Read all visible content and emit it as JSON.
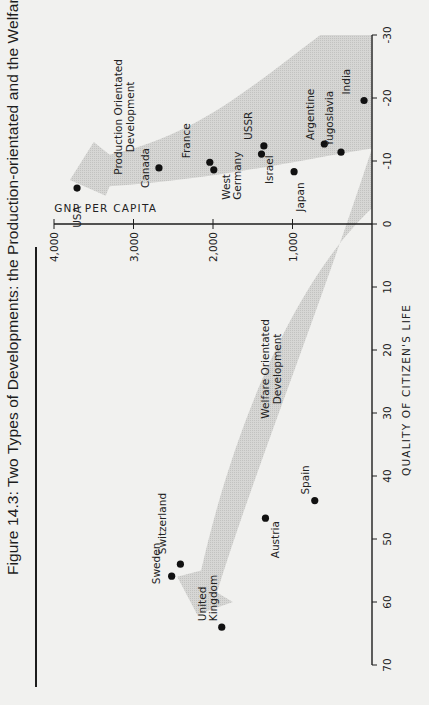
{
  "figure": {
    "title": "Figure 14.3: Two Types of Developments: the Production-orientated and the Welfare-orientated",
    "orientation": "rotated 90° counter-clockwise on page"
  },
  "chart_data": {
    "type": "scatter",
    "title": "Figure 14.3: Two Types of Developments: the Production-orientated and the Welfare-orientated",
    "xlabel": "QUALITY OF CITIZEN'S LIFE",
    "ylabel": "GNP PER CAPITA",
    "xlim": [
      70,
      -30
    ],
    "ylim": [
      0,
      4000
    ],
    "x_ticks": [
      70,
      60,
      50,
      40,
      30,
      20,
      10,
      0,
      -10,
      -20,
      -30
    ],
    "x_tick_labels": [
      "70",
      "60",
      "50",
      "40",
      "30",
      "20",
      "10",
      "0",
      "-10",
      "-20",
      "-30"
    ],
    "y_ticks": [
      0,
      1000,
      2000,
      3000,
      4000
    ],
    "y_tick_labels": [
      "0",
      "1,000",
      "2,000",
      "3,000",
      "4,000"
    ],
    "grid": false,
    "annotations": [
      {
        "text": [
          "Production Orientated",
          "Development"
        ],
        "x": -17,
        "y": 3150
      },
      {
        "text": [
          "Welfare Orientated",
          "Development"
        ],
        "x": 23,
        "y": 1300
      }
    ],
    "arrows": [
      {
        "name": "production-orientated",
        "description": "broad shaded arrow from lower right (-30, 0) curving up toward USA (high GNP, low quality)"
      },
      {
        "name": "welfare-orientated",
        "description": "broad shaded arrow from origin area curving toward United Kingdom/Sweden (high quality, moderate GNP)"
      }
    ],
    "points": [
      {
        "label": "USA",
        "x": -5.7,
        "y": 3710
      },
      {
        "label": "Canada",
        "x": -8.9,
        "y": 2680
      },
      {
        "label": "France",
        "x": -9.8,
        "y": 2040
      },
      {
        "label": "West Germany",
        "x": -8.6,
        "y": 1990
      },
      {
        "label": "Israel",
        "x": -11.1,
        "y": 1390
      },
      {
        "label": "USSR",
        "x": -12.4,
        "y": 1360
      },
      {
        "label": "Japan",
        "x": -8.3,
        "y": 980
      },
      {
        "label": "Argentine",
        "x": -12.7,
        "y": 600
      },
      {
        "label": "Yugoslavia",
        "x": -11.4,
        "y": 390
      },
      {
        "label": "India",
        "x": -19.6,
        "y": 100
      },
      {
        "label": "Spain",
        "x": 43.9,
        "y": 720
      },
      {
        "label": "Austria",
        "x": 46.7,
        "y": 1340
      },
      {
        "label": "Switzerland",
        "x": 54.0,
        "y": 2410
      },
      {
        "label": "Sweden",
        "x": 55.9,
        "y": 2520
      },
      {
        "label": "United Kingdom",
        "x": 64.0,
        "y": 1890
      }
    ]
  },
  "colors": {
    "background": "#f1f1ef",
    "ink": "#1d1d1d",
    "arrow_fill": "#cfcfcd"
  }
}
